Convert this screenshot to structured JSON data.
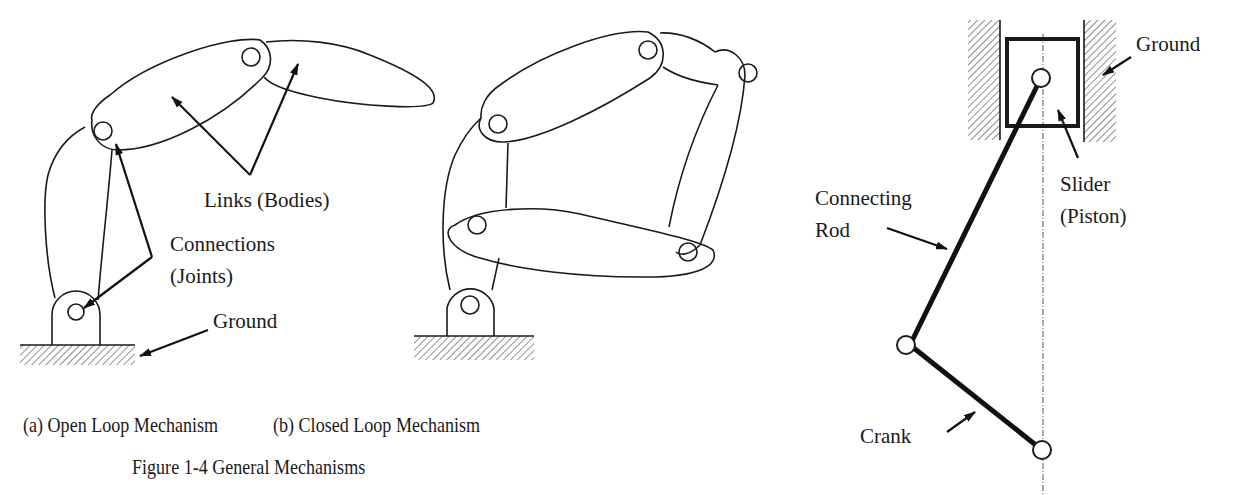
{
  "figure": {
    "caption": "Figure 1-4  General Mechanisms",
    "panel_a": {
      "caption": "(a) Open Loop Mechanism",
      "labels": {
        "links": "Links (Bodies)",
        "connections_line1": "Connections",
        "connections_line2": "(Joints)",
        "ground": "Ground"
      }
    },
    "panel_b": {
      "caption": "(b) Closed Loop Mechanism"
    },
    "panel_c": {
      "labels": {
        "ground": "Ground",
        "slider_line1": "Slider",
        "slider_line2": "(Piston)",
        "rod_line1": "Connecting",
        "rod_line2": "Rod",
        "crank": "Crank"
      }
    }
  }
}
